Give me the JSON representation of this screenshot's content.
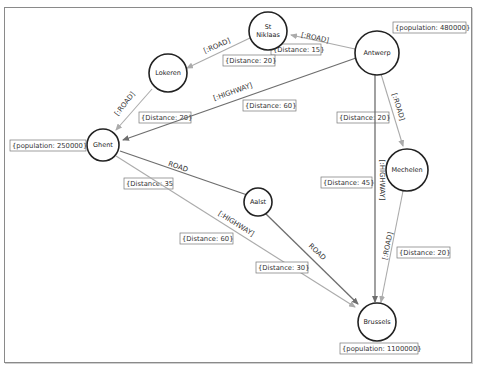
{
  "nodes": {
    "st_niklaas": {
      "label_line1": "St",
      "label_line2": "Niklaas"
    },
    "antwerp": {
      "label": "Antwerp",
      "property": "{population: 480000}"
    },
    "lokeren": {
      "label": "Lokeren"
    },
    "ghent": {
      "label": "Ghent",
      "property": "{population: 250000}"
    },
    "aalst": {
      "label": "Aalst"
    },
    "mechelen": {
      "label": "Mechelen"
    },
    "brussels": {
      "label": "Brussels",
      "property": "{population: 1100000}"
    }
  },
  "edges": {
    "antwerp_stniklaas": {
      "type": "[:ROAD]",
      "property": "{Distance: 15}"
    },
    "stniklaas_lokeren": {
      "type": "[:ROAD]",
      "property": "{Distance: 20}"
    },
    "lokeren_ghent": {
      "type": "[:ROAD]",
      "property": "{Distance: 20}"
    },
    "antwerp_ghent": {
      "type": "[:HIGHWAY]",
      "property": "{Distance: 60}"
    },
    "antwerp_mechelen": {
      "type": "[:ROAD]",
      "property": "{Distance: 20}"
    },
    "antwerp_brussels": {
      "type": "[:HIGHWAY]",
      "property": "{Distance: 45}"
    },
    "mechelen_brussels": {
      "type": "[:ROAD]",
      "property": "{Distance: 20}"
    },
    "ghent_aalst": {
      "type": "ROAD",
      "property": "{Distance: 35"
    },
    "ghent_brussels": {
      "type": "[:HIGHWAY]",
      "property": "{Distance: 60}"
    },
    "aalst_brussels": {
      "type": "ROAD",
      "property": "{Distance: 30}"
    }
  }
}
